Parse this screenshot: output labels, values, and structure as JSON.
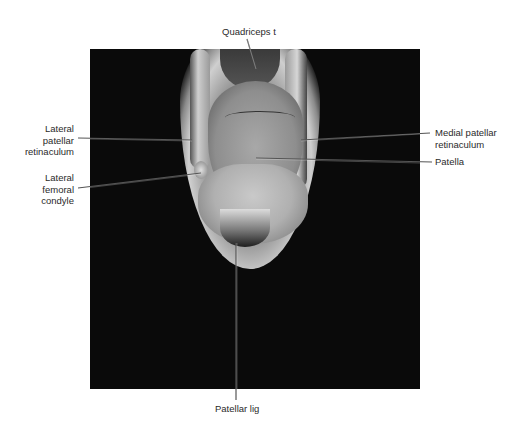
{
  "figure": {
    "image_type": "MRI knee axial",
    "labels": {
      "quadriceps": "Quadriceps t",
      "lateral_patellar_retinaculum": [
        "Lateral",
        "patellar",
        "retinaculum"
      ],
      "lateral_femoral_condyle": [
        "Lateral",
        "femoral",
        "condyle"
      ],
      "medial_patellar_retinaculum": [
        "Medial patellar",
        "retinaculum"
      ],
      "patella": "Patella",
      "patellar_lig": "Patellar lig"
    },
    "colors": {
      "background": "#ffffff",
      "image_bg": "#0a0a0a",
      "label_text": "#2a2a2a",
      "leader_line": "#555555"
    }
  }
}
